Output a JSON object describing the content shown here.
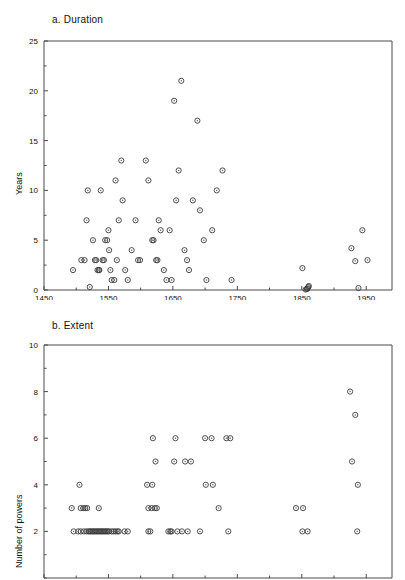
{
  "figure": {
    "background": "#ffffff",
    "marker_color": "#3a3a3a",
    "axis_color": "#4a4a4a"
  },
  "panels": [
    {
      "id": "a",
      "title": "a.  Duration",
      "ylabel": "Years"
    },
    {
      "id": "b",
      "title": "b.  Extent",
      "ylabel": "Number of powers"
    }
  ],
  "chart_data": [
    {
      "type": "scatter",
      "title": "a.  Duration",
      "xlabel": "",
      "ylabel": "Years",
      "xlim": [
        1450,
        1990
      ],
      "ylim": [
        0,
        25
      ],
      "xticks": [
        1450,
        1550,
        1650,
        1750,
        1850,
        1950
      ],
      "xticklabels": [
        "1450",
        "1550",
        "1650",
        "1750",
        "1850",
        "1950"
      ],
      "xminor_step": 50,
      "yticks": [
        0,
        5,
        10,
        15,
        20,
        25
      ],
      "yticklabels": [
        "0",
        "5",
        "10",
        "15",
        "20",
        "25"
      ],
      "yminor_step": 2.5,
      "grid": false,
      "legend": null,
      "marker": "open-circle",
      "points": [
        [
          1495,
          2
        ],
        [
          1508,
          3
        ],
        [
          1513,
          3
        ],
        [
          1516,
          7
        ],
        [
          1518,
          10
        ],
        [
          1521,
          0.3
        ],
        [
          1526,
          5
        ],
        [
          1529,
          3
        ],
        [
          1531,
          3
        ],
        [
          1533,
          2
        ],
        [
          1535,
          2
        ],
        [
          1536,
          2
        ],
        [
          1538,
          10
        ],
        [
          1541,
          3
        ],
        [
          1543,
          3
        ],
        [
          1545,
          5
        ],
        [
          1548,
          5
        ],
        [
          1550,
          6
        ],
        [
          1551,
          4
        ],
        [
          1553,
          2
        ],
        [
          1555,
          1
        ],
        [
          1559,
          1
        ],
        [
          1561,
          11
        ],
        [
          1563,
          3
        ],
        [
          1566,
          7
        ],
        [
          1570,
          13
        ],
        [
          1572,
          9
        ],
        [
          1576,
          2
        ],
        [
          1580,
          1
        ],
        [
          1586,
          4
        ],
        [
          1592,
          7
        ],
        [
          1596,
          3
        ],
        [
          1599,
          3
        ],
        [
          1608,
          13
        ],
        [
          1612,
          11
        ],
        [
          1618,
          5
        ],
        [
          1620,
          5
        ],
        [
          1624,
          3
        ],
        [
          1626,
          3
        ],
        [
          1628,
          7
        ],
        [
          1631,
          6
        ],
        [
          1636,
          2
        ],
        [
          1640,
          1
        ],
        [
          1645,
          6
        ],
        [
          1648,
          1
        ],
        [
          1652,
          19
        ],
        [
          1655,
          9
        ],
        [
          1659,
          12
        ],
        [
          1663,
          21
        ],
        [
          1668,
          4
        ],
        [
          1672,
          3
        ],
        [
          1675,
          2
        ],
        [
          1681,
          9
        ],
        [
          1688,
          17
        ],
        [
          1692,
          8
        ],
        [
          1698,
          5
        ],
        [
          1702,
          1
        ],
        [
          1711,
          6
        ],
        [
          1718,
          10
        ],
        [
          1727,
          12
        ],
        [
          1741,
          1
        ],
        [
          1856,
          0.05
        ],
        [
          1858,
          0.1
        ],
        [
          1859,
          0.15
        ],
        [
          1860,
          0.3
        ],
        [
          1861,
          0.4
        ],
        [
          1851,
          2.2
        ],
        [
          1927,
          4.2
        ],
        [
          1933,
          2.9
        ],
        [
          1938,
          0.2
        ],
        [
          1944,
          6
        ],
        [
          1952,
          3
        ]
      ]
    },
    {
      "type": "scatter",
      "title": "b.  Extent",
      "xlabel": "",
      "ylabel": "Number of powers",
      "xlim": [
        1450,
        1990
      ],
      "ylim": [
        0,
        10
      ],
      "xticks": [
        1450,
        1550,
        1650,
        1750,
        1850,
        1950
      ],
      "xticklabels": [
        "1450",
        "1550",
        "1650",
        "1750",
        "1850",
        "1950"
      ],
      "xminor_step": 50,
      "yticks": [
        2,
        4,
        6,
        8,
        10
      ],
      "yticklabels": [
        "2",
        "4",
        "6",
        "8",
        "10"
      ],
      "yminor_step": 1,
      "grid": false,
      "legend": null,
      "marker": "open-circle",
      "points": [
        [
          1493,
          3
        ],
        [
          1505,
          4
        ],
        [
          1507,
          3
        ],
        [
          1511,
          3
        ],
        [
          1514,
          3
        ],
        [
          1517,
          3
        ],
        [
          1535,
          3
        ],
        [
          1496,
          2
        ],
        [
          1503,
          2
        ],
        [
          1507,
          2
        ],
        [
          1512,
          2
        ],
        [
          1516,
          2
        ],
        [
          1519,
          2
        ],
        [
          1521,
          2
        ],
        [
          1523,
          2
        ],
        [
          1525,
          2
        ],
        [
          1527,
          2
        ],
        [
          1529,
          2
        ],
        [
          1531,
          2
        ],
        [
          1533,
          2
        ],
        [
          1535,
          2
        ],
        [
          1537,
          2
        ],
        [
          1539,
          2
        ],
        [
          1541,
          2
        ],
        [
          1543,
          2
        ],
        [
          1545,
          2
        ],
        [
          1547,
          2
        ],
        [
          1549,
          2
        ],
        [
          1551,
          2
        ],
        [
          1555,
          2
        ],
        [
          1558,
          2
        ],
        [
          1561,
          2
        ],
        [
          1564,
          2
        ],
        [
          1566,
          2
        ],
        [
          1575,
          2
        ],
        [
          1580,
          2
        ],
        [
          1612,
          2
        ],
        [
          1615,
          2
        ],
        [
          1643,
          2
        ],
        [
          1646,
          2
        ],
        [
          1648,
          2
        ],
        [
          1657,
          2
        ],
        [
          1664,
          2
        ],
        [
          1673,
          2
        ],
        [
          1692,
          2
        ],
        [
          1736,
          2
        ],
        [
          1851,
          2
        ],
        [
          1859,
          2
        ],
        [
          1936,
          2
        ],
        [
          1612,
          3
        ],
        [
          1617,
          3
        ],
        [
          1622,
          3
        ],
        [
          1625,
          3
        ],
        [
          1721,
          3
        ],
        [
          1841,
          3
        ],
        [
          1852,
          3
        ],
        [
          1610,
          4
        ],
        [
          1618,
          4
        ],
        [
          1701,
          4
        ],
        [
          1712,
          4
        ],
        [
          1937,
          4
        ],
        [
          1623,
          5
        ],
        [
          1652,
          5
        ],
        [
          1669,
          5
        ],
        [
          1678,
          5
        ],
        [
          1928,
          5
        ],
        [
          1619,
          6
        ],
        [
          1654,
          6
        ],
        [
          1700,
          6
        ],
        [
          1710,
          6
        ],
        [
          1733,
          6
        ],
        [
          1739,
          6
        ],
        [
          1933,
          7
        ],
        [
          1925,
          8
        ]
      ]
    }
  ]
}
